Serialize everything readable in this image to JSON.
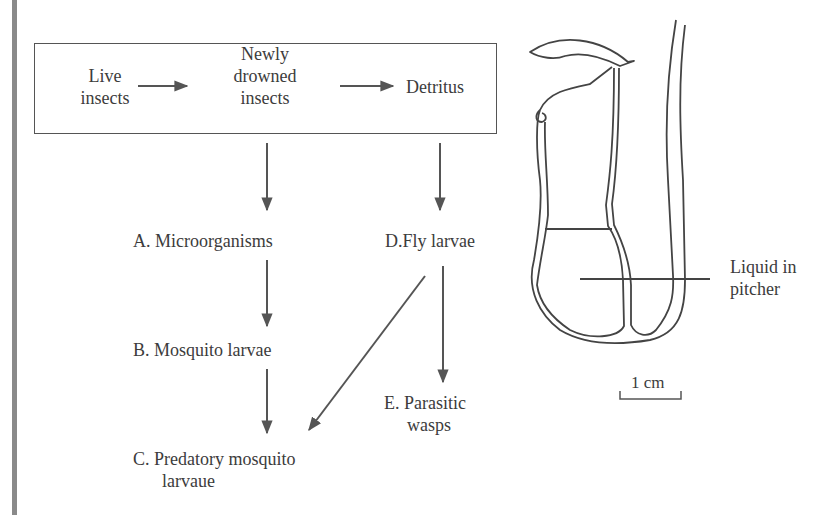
{
  "food_web": {
    "box": {
      "live_insects": [
        "Live",
        "insects"
      ],
      "newly_drowned": [
        "Newly",
        "drowned",
        "insects"
      ],
      "detritus": "Detritus"
    },
    "nodes": {
      "A": "A. Microorganisms",
      "B": "B. Mosquito larvae",
      "C_line1": "C. Predatory mosquito",
      "C_line2": "larvaue",
      "D": "D.Fly larvae",
      "E_line1": "E. Parasitic",
      "E_line2": "wasps"
    },
    "edges": [
      {
        "from": "Live insects",
        "to": "Newly drowned insects"
      },
      {
        "from": "Newly drowned insects",
        "to": "Detritus"
      },
      {
        "from": "box",
        "to": "A"
      },
      {
        "from": "box",
        "to": "D"
      },
      {
        "from": "A",
        "to": "B"
      },
      {
        "from": "B",
        "to": "C"
      },
      {
        "from": "D",
        "to": "C"
      },
      {
        "from": "D",
        "to": "E"
      }
    ]
  },
  "pitcher": {
    "liquid_label": [
      "Liquid in",
      "pitcher"
    ],
    "scale_label": "1 cm"
  },
  "colors": {
    "line": "#555555",
    "text": "#3c3c3c",
    "edge_bar": "#8a8a8a"
  }
}
